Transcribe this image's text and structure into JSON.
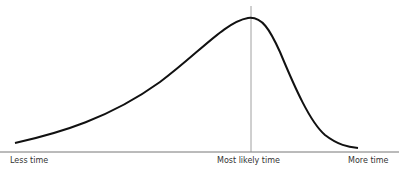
{
  "diagram": {
    "type": "skewed distribution curve",
    "labels": {
      "left": "Less time",
      "middle": "Most likely time",
      "right": "More time"
    },
    "mode_position": "Most likely time",
    "skew": "left-skewed (long left tail)"
  }
}
